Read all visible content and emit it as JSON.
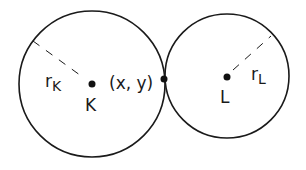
{
  "diagram": {
    "colors": {
      "stroke": "#1a1a1a",
      "background": "#ffffff"
    },
    "circles": [
      {
        "id": "K",
        "center_label": "K",
        "radius_label_main": "r",
        "radius_label_sub": "K",
        "cx": 92,
        "cy": 84,
        "r": 73
      },
      {
        "id": "L",
        "center_label": "L",
        "radius_label_main": "r",
        "radius_label_sub": "L",
        "cx": 227,
        "cy": 76,
        "r": 62
      }
    ],
    "tangent_point": {
      "label": "(x, y)",
      "x": 164,
      "y": 79
    }
  }
}
